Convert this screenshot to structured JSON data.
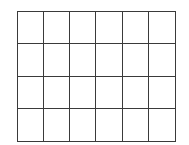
{
  "diagram": {
    "type": "grid",
    "rows": 4,
    "columns": 6,
    "line_color": "#3a3a3a",
    "fill_color": "#ffffff"
  }
}
